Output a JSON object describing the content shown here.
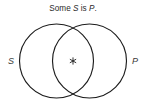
{
  "figure": {
    "type": "venn-diagram",
    "background_color": "#ffffff",
    "stroke_color": "#1c1c1c",
    "width": 147,
    "height": 102
  },
  "caption": {
    "full_text": "Some S is P.",
    "part_1": "Some ",
    "subject_term": "S",
    "part_2": " is ",
    "predicate_term": "P",
    "part_3": ".",
    "x": 73,
    "y": 11
  },
  "labels": {
    "left": "S",
    "right": "P"
  },
  "circles": [
    {
      "name": "S",
      "cx": 56.5,
      "cy": 61,
      "r": 37
    },
    {
      "name": "P",
      "cx": 89.5,
      "cy": 61,
      "r": 37
    }
  ],
  "marks": [
    {
      "name": "asterisk",
      "symbol": "*",
      "cx": 73,
      "cy": 61,
      "region": "intersection"
    }
  ]
}
